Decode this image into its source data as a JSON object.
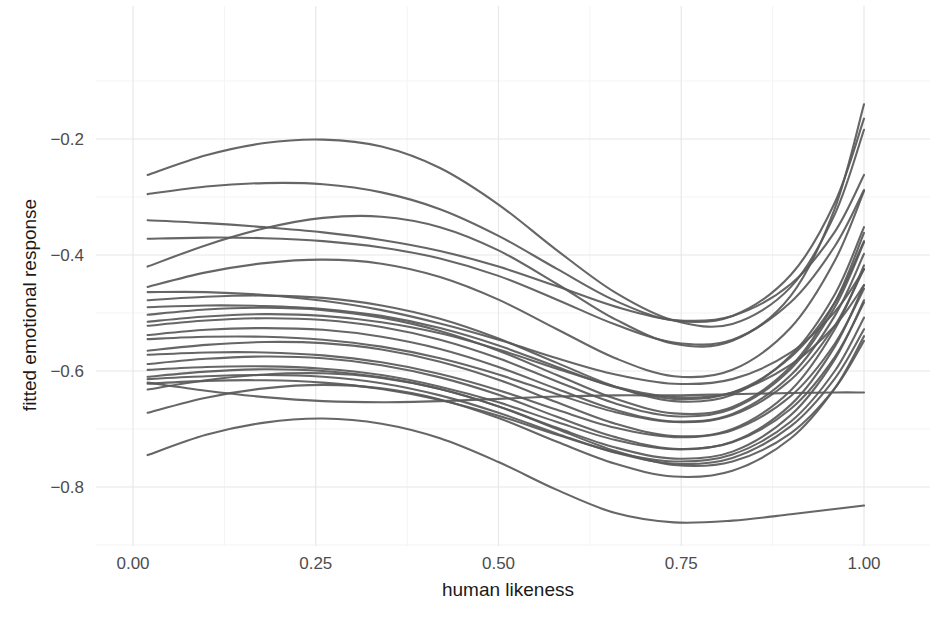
{
  "chart_data": {
    "type": "line",
    "title": "",
    "subtitle": "",
    "xlabel": "human likeness",
    "ylabel": "fitted emotional response",
    "xlim": [
      -0.02,
      1.04
    ],
    "ylim": [
      -0.9,
      -0.02
    ],
    "xticks": [
      0.0,
      0.25,
      0.5,
      0.75,
      1.0
    ],
    "xticklabels": [
      "0.00",
      "0.25",
      "0.50",
      "0.75",
      "1.00"
    ],
    "yticks": [
      -0.2,
      -0.4,
      -0.6,
      -0.8
    ],
    "yticklabels": [
      "−0.2",
      "−0.4",
      "−0.6",
      "−0.8"
    ],
    "grid": true,
    "minor_grid": true,
    "legend": "none",
    "line_color": "#595959",
    "line_width": 2.1,
    "grid_color": "#e8e8e8",
    "minor_grid_color": "#f3f3f3",
    "background": "#fdfdfd",
    "panel_background": "#ffffff",
    "n_series": 25,
    "x": [
      0.02,
      0.1,
      0.18,
      0.26,
      0.34,
      0.42,
      0.5,
      0.58,
      0.66,
      0.74,
      0.82,
      0.9,
      0.96,
      1.0
    ],
    "series": [
      {
        "name": "curve-01",
        "values": [
          -0.262,
          -0.228,
          -0.207,
          -0.201,
          -0.213,
          -0.25,
          -0.313,
          -0.392,
          -0.465,
          -0.513,
          -0.519,
          -0.455,
          -0.33,
          -0.184
        ]
      },
      {
        "name": "curve-02",
        "values": [
          -0.295,
          -0.282,
          -0.276,
          -0.278,
          -0.292,
          -0.321,
          -0.367,
          -0.424,
          -0.479,
          -0.513,
          -0.505,
          -0.434,
          -0.31,
          -0.165
        ]
      },
      {
        "name": "curve-03",
        "values": [
          -0.42,
          -0.383,
          -0.354,
          -0.336,
          -0.334,
          -0.352,
          -0.392,
          -0.45,
          -0.511,
          -0.553,
          -0.548,
          -0.47,
          -0.32,
          -0.14
        ]
      },
      {
        "name": "curve-04",
        "values": [
          -0.34,
          -0.345,
          -0.352,
          -0.361,
          -0.374,
          -0.393,
          -0.42,
          -0.454,
          -0.489,
          -0.512,
          -0.505,
          -0.45,
          -0.36,
          -0.262
        ]
      },
      {
        "name": "curve-05",
        "values": [
          -0.372,
          -0.37,
          -0.371,
          -0.376,
          -0.387,
          -0.406,
          -0.436,
          -0.477,
          -0.52,
          -0.551,
          -0.546,
          -0.481,
          -0.385,
          -0.288
        ]
      },
      {
        "name": "curve-06",
        "values": [
          -0.455,
          -0.43,
          -0.414,
          -0.408,
          -0.415,
          -0.438,
          -0.477,
          -0.528,
          -0.578,
          -0.609,
          -0.598,
          -0.525,
          -0.41,
          -0.29
        ]
      },
      {
        "name": "curve-07",
        "values": [
          -0.478,
          -0.472,
          -0.47,
          -0.474,
          -0.487,
          -0.51,
          -0.544,
          -0.586,
          -0.627,
          -0.652,
          -0.641,
          -0.573,
          -0.468,
          -0.352
        ]
      },
      {
        "name": "curve-08",
        "values": [
          -0.49,
          -0.487,
          -0.488,
          -0.493,
          -0.505,
          -0.526,
          -0.556,
          -0.593,
          -0.628,
          -0.648,
          -0.637,
          -0.576,
          -0.482,
          -0.376
        ]
      },
      {
        "name": "curve-09",
        "values": [
          -0.503,
          -0.494,
          -0.491,
          -0.495,
          -0.508,
          -0.531,
          -0.565,
          -0.607,
          -0.648,
          -0.673,
          -0.662,
          -0.592,
          -0.482,
          -0.362
        ]
      },
      {
        "name": "curve-10",
        "values": [
          -0.522,
          -0.513,
          -0.509,
          -0.512,
          -0.524,
          -0.546,
          -0.578,
          -0.618,
          -0.656,
          -0.678,
          -0.665,
          -0.596,
          -0.49,
          -0.378
        ]
      },
      {
        "name": "curve-11",
        "values": [
          -0.538,
          -0.529,
          -0.526,
          -0.529,
          -0.541,
          -0.562,
          -0.593,
          -0.631,
          -0.667,
          -0.687,
          -0.674,
          -0.607,
          -0.505,
          -0.398
        ]
      },
      {
        "name": "curve-12",
        "values": [
          -0.545,
          -0.541,
          -0.541,
          -0.546,
          -0.558,
          -0.578,
          -0.606,
          -0.64,
          -0.671,
          -0.688,
          -0.676,
          -0.615,
          -0.522,
          -0.424
        ]
      },
      {
        "name": "curve-13",
        "values": [
          -0.565,
          -0.555,
          -0.55,
          -0.552,
          -0.563,
          -0.584,
          -0.615,
          -0.654,
          -0.691,
          -0.712,
          -0.7,
          -0.633,
          -0.528,
          -0.418
        ]
      },
      {
        "name": "curve-14",
        "values": [
          -0.572,
          -0.568,
          -0.568,
          -0.573,
          -0.585,
          -0.605,
          -0.633,
          -0.667,
          -0.698,
          -0.714,
          -0.702,
          -0.643,
          -0.553,
          -0.458
        ]
      },
      {
        "name": "curve-15",
        "values": [
          -0.588,
          -0.579,
          -0.575,
          -0.578,
          -0.59,
          -0.611,
          -0.641,
          -0.679,
          -0.714,
          -0.734,
          -0.722,
          -0.658,
          -0.558,
          -0.452
        ]
      },
      {
        "name": "curve-16",
        "values": [
          -0.598,
          -0.593,
          -0.592,
          -0.596,
          -0.607,
          -0.627,
          -0.654,
          -0.688,
          -0.719,
          -0.735,
          -0.723,
          -0.665,
          -0.576,
          -0.482
        ]
      },
      {
        "name": "curve-17",
        "values": [
          -0.61,
          -0.601,
          -0.597,
          -0.6,
          -0.611,
          -0.631,
          -0.661,
          -0.698,
          -0.732,
          -0.751,
          -0.739,
          -0.676,
          -0.58,
          -0.478
        ]
      },
      {
        "name": "curve-18",
        "values": [
          -0.622,
          -0.617,
          -0.616,
          -0.62,
          -0.631,
          -0.65,
          -0.677,
          -0.71,
          -0.74,
          -0.756,
          -0.744,
          -0.687,
          -0.6,
          -0.508
        ]
      },
      {
        "name": "curve-19",
        "values": [
          -0.614,
          -0.609,
          -0.607,
          -0.61,
          -0.621,
          -0.642,
          -0.672,
          -0.708,
          -0.741,
          -0.76,
          -0.75,
          -0.695,
          -0.613,
          -0.528
        ]
      },
      {
        "name": "curve-20",
        "values": [
          -0.632,
          -0.616,
          -0.606,
          -0.604,
          -0.612,
          -0.631,
          -0.661,
          -0.7,
          -0.738,
          -0.762,
          -0.756,
          -0.707,
          -0.63,
          -0.548
        ]
      },
      {
        "name": "curve-21",
        "values": [
          -0.464,
          -0.464,
          -0.469,
          -0.479,
          -0.495,
          -0.518,
          -0.546,
          -0.578,
          -0.606,
          -0.622,
          -0.614,
          -0.568,
          -0.498,
          -0.425
        ]
      },
      {
        "name": "curve-22",
        "values": [
          -0.515,
          -0.506,
          -0.502,
          -0.505,
          -0.516,
          -0.535,
          -0.563,
          -0.596,
          -0.627,
          -0.645,
          -0.637,
          -0.589,
          -0.522,
          -0.452
        ]
      },
      {
        "name": "curve-23",
        "values": [
          -0.62,
          -0.634,
          -0.645,
          -0.652,
          -0.654,
          -0.652,
          -0.648,
          -0.644,
          -0.642,
          -0.642,
          -0.64,
          -0.638,
          -0.637,
          -0.637
        ]
      },
      {
        "name": "curve-24",
        "values": [
          -0.672,
          -0.646,
          -0.63,
          -0.624,
          -0.63,
          -0.649,
          -0.681,
          -0.722,
          -0.76,
          -0.782,
          -0.772,
          -0.716,
          -0.63,
          -0.54
        ]
      },
      {
        "name": "curve-25",
        "values": [
          -0.745,
          -0.71,
          -0.689,
          -0.682,
          -0.691,
          -0.716,
          -0.757,
          -0.805,
          -0.845,
          -0.861,
          -0.858,
          -0.847,
          -0.838,
          -0.832
        ]
      }
    ],
    "annotations": []
  }
}
